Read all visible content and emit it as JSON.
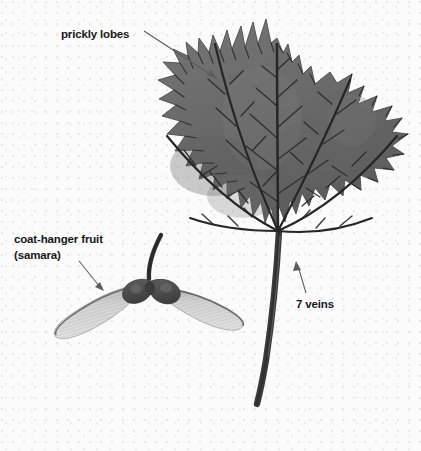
{
  "figure": {
    "background_color": "#fbfbfb",
    "leaf_color": "#6d6d6d",
    "leaf_shadow_color": "#555555",
    "vein_color": "#272727",
    "petiole_color": "#3a3a3a",
    "samara_seed_color": "#4d4d4d",
    "samara_wing_color": "#d2d2d2",
    "label_color": "#18181a",
    "arrow_color": "#5a5a5a"
  },
  "annotations": [
    {
      "id": "prickly-lobes",
      "lines": [
        "prickly lobes"
      ],
      "arrow_from": [
        144,
        31
      ],
      "arrow_to": [
        218,
        79
      ]
    },
    {
      "id": "coat-hanger-fruit",
      "lines": [
        "coat-hanger fruit",
        "(samara)"
      ],
      "arrow_from": [
        79,
        261
      ],
      "arrow_to": [
        104,
        291
      ]
    },
    {
      "id": "seven-veins",
      "lines": [
        "7 veins"
      ],
      "arrow_from": [
        306,
        293
      ],
      "arrow_to": [
        296,
        261
      ]
    }
  ],
  "leaf": {
    "vein_count": 7,
    "lobe_count": 5,
    "center_point": [
      278,
      232
    ],
    "apex_point": [
      277,
      38
    ]
  }
}
